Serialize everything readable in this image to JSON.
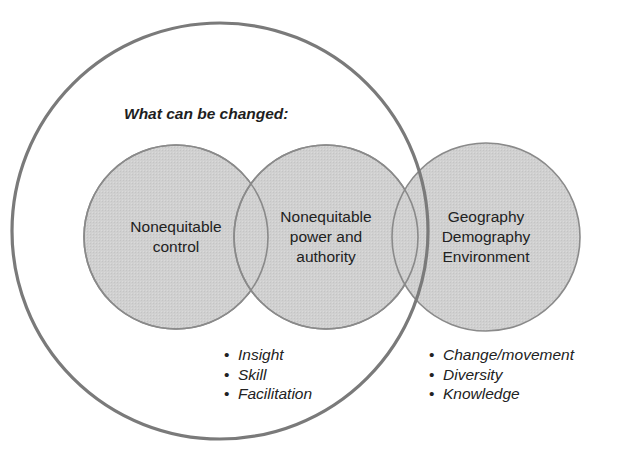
{
  "diagram": {
    "heading": "What can be changed:",
    "circles": [
      {
        "id": "control",
        "lines": [
          "Nonequitable",
          "control"
        ]
      },
      {
        "id": "power",
        "lines": [
          "Nonequitable",
          "power and",
          "authority"
        ]
      },
      {
        "id": "context",
        "lines": [
          "Geography",
          "Demography",
          "Environment"
        ]
      }
    ],
    "left_bullets": [
      "Insight",
      "Skill",
      "Facilitation"
    ],
    "right_bullets": [
      "Change/movement",
      "Diversity",
      "Knowledge"
    ],
    "colors": {
      "circle_fill": "#cfcfcf",
      "circle_stroke": "#8a8a8a",
      "outer_stroke": "#7a7a7a",
      "text": "#222222"
    }
  }
}
